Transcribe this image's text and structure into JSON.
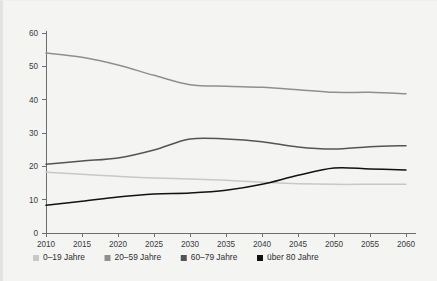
{
  "chart_data": {
    "type": "line",
    "title": "",
    "subtitle": "",
    "xlabel": "",
    "ylabel": "",
    "xlim": [
      2010,
      2060
    ],
    "ylim": [
      0,
      60
    ],
    "grid": false,
    "legend_position": "bottom",
    "xticks": [
      "2010",
      "2015",
      "2020",
      "2025",
      "2030",
      "2035",
      "2040",
      "2045",
      "2050",
      "2055",
      "2060"
    ],
    "yticks": [
      "0",
      "10",
      "20",
      "30",
      "40",
      "50",
      "60"
    ],
    "x": [
      2010,
      2015,
      2020,
      2025,
      2030,
      2035,
      2040,
      2045,
      2050,
      2055,
      2060
    ],
    "series": [
      {
        "name": "0–19 Jahre",
        "color": "#c8c8c6",
        "values": [
          18.2,
          17.6,
          17.0,
          16.5,
          16.2,
          15.8,
          15.2,
          14.8,
          14.6,
          14.6,
          14.6
        ]
      },
      {
        "name": "20–59 Jahre",
        "color": "#8f8f8d",
        "values": [
          54.0,
          52.7,
          50.4,
          47.3,
          44.5,
          44.0,
          43.7,
          43.0,
          42.2,
          42.2,
          41.8
        ]
      },
      {
        "name": "60–79 Jahre",
        "color": "#545454",
        "values": [
          20.6,
          21.6,
          22.5,
          24.9,
          28.2,
          28.2,
          27.4,
          25.8,
          25.2,
          25.9,
          26.2
        ]
      },
      {
        "name": "über 80 Jahre",
        "color": "#111111",
        "values": [
          8.3,
          9.5,
          10.8,
          11.7,
          12.0,
          12.8,
          14.6,
          17.3,
          19.5,
          19.2,
          18.9
        ]
      }
    ]
  },
  "legend": {
    "items": [
      {
        "label": "0–19 Jahre",
        "color": "#c8c8c6"
      },
      {
        "label": "20–59 Jahre",
        "color": "#8f8f8d"
      },
      {
        "label": "60–79 Jahre",
        "color": "#545454"
      },
      {
        "label": "über 80 Jahre",
        "color": "#111111"
      }
    ]
  }
}
